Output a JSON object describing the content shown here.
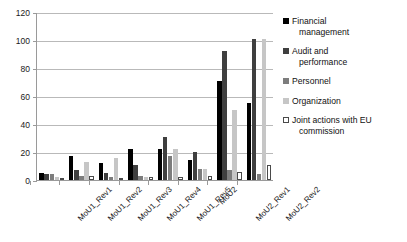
{
  "chart_data": {
    "type": "bar",
    "title": "",
    "xlabel": "",
    "ylabel": "",
    "ylim": [
      0,
      120
    ],
    "yticks": [
      0,
      20,
      40,
      60,
      80,
      100,
      120
    ],
    "grid": true,
    "legend_position": "right",
    "categories": [
      "MoU1_Rev1",
      "MoU1_Rev2",
      "MoU1_Rev3",
      "MoU1_Rev4",
      "MoU1_Rev5",
      "MoU2",
      "MoU2_Rev1",
      "MoU2_Rev2"
    ],
    "series": [
      {
        "name": "Financial management",
        "name_lines": [
          "Financial",
          "management"
        ],
        "color": "#000000",
        "values": [
          5,
          17,
          12,
          22,
          22,
          14,
          71,
          55
        ]
      },
      {
        "name": "Audit and performance",
        "name_lines": [
          "Audit and",
          "performance"
        ],
        "color": "#3f3f3f",
        "values": [
          4,
          7,
          5,
          11,
          31,
          20,
          92,
          101
        ]
      },
      {
        "name": "Personnel",
        "name_lines": [
          "Personnel"
        ],
        "color": "#7d7d7d",
        "values": [
          4,
          3,
          2,
          3,
          17,
          8,
          7,
          4
        ]
      },
      {
        "name": "Organization",
        "name_lines": [
          "Organization"
        ],
        "color": "#c6c6c6",
        "values": [
          2,
          13,
          16,
          2,
          22,
          8,
          50,
          101
        ]
      },
      {
        "name": "Joint actions with EU commission",
        "name_lines": [
          "Joint actions with EU",
          "commission"
        ],
        "color": "#ffffff",
        "values": [
          1,
          3,
          1,
          2,
          2,
          3,
          6,
          11
        ]
      }
    ]
  }
}
